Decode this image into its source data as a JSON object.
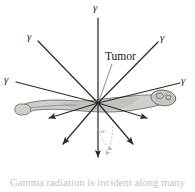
{
  "figure": {
    "caption": "Gamma radiation is incident along many",
    "tumor_label": "Tumor",
    "angle_label": "α",
    "colors": {
      "background": "#ffffff",
      "ray": "#2b2b2b",
      "body_fill": "#cfcfca",
      "body_outline": "#6e6e6e",
      "caption_text": "#c2c2c2",
      "leader_line": "#6b6b6b",
      "dotted_arc": "#b8b8b8",
      "label_text": "#1a1a1a"
    },
    "convergence_point": {
      "x": 98,
      "y": 103
    }
  },
  "gamma_labels": [
    {
      "id": "gamma-top",
      "symbol": "γ",
      "x": 93,
      "y": 2
    },
    {
      "id": "gamma-upper-left",
      "symbol": "γ",
      "x": 27,
      "y": 31
    },
    {
      "id": "gamma-upper-right",
      "symbol": "γ",
      "x": 160,
      "y": 32
    },
    {
      "id": "gamma-left",
      "symbol": "γ",
      "x": 4,
      "y": 74
    },
    {
      "id": "gamma-right",
      "symbol": "γ",
      "x": 181,
      "y": 75
    }
  ],
  "rays": [
    {
      "id": "ray-from-top",
      "x1": 98,
      "y1": 18,
      "x2": 98,
      "y2": 103,
      "arrow": false
    },
    {
      "id": "ray-from-upper-left",
      "x1": 38,
      "y1": 41,
      "x2": 98,
      "y2": 103,
      "arrow": false
    },
    {
      "id": "ray-from-upper-right",
      "x1": 158,
      "y1": 42,
      "x2": 98,
      "y2": 103,
      "arrow": false
    },
    {
      "id": "ray-from-left",
      "x1": 16,
      "y1": 82,
      "x2": 98,
      "y2": 103,
      "arrow": false
    },
    {
      "id": "ray-from-right",
      "x1": 180,
      "y1": 83,
      "x2": 98,
      "y2": 103,
      "arrow": false
    },
    {
      "id": "ray-exit-down",
      "x1": 98,
      "y1": 103,
      "x2": 98,
      "y2": 157,
      "arrow": true
    },
    {
      "id": "ray-exit-lower-left",
      "x1": 98,
      "y1": 103,
      "x2": 63,
      "y2": 144,
      "arrow": true
    },
    {
      "id": "ray-exit-lower-right",
      "x1": 98,
      "y1": 103,
      "x2": 133,
      "y2": 144,
      "arrow": true
    },
    {
      "id": "ray-exit-left",
      "x1": 98,
      "y1": 103,
      "x2": 49,
      "y2": 118,
      "arrow": true
    },
    {
      "id": "ray-exit-right",
      "x1": 98,
      "y1": 103,
      "x2": 147,
      "y2": 118,
      "arrow": true
    }
  ],
  "tumor_leader": {
    "x1": 112,
    "y1": 64,
    "x2": 99,
    "y2": 101
  },
  "angle_arcs": [
    {
      "id": "angle-arc-inner",
      "path": "M 98 128 Q 102 143 112 150"
    },
    {
      "id": "angle-arc-outer",
      "path": "M 113 126 Q 112 144 106 155"
    }
  ]
}
